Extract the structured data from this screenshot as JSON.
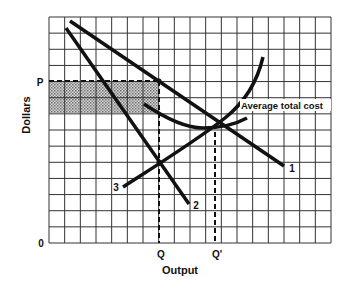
{
  "diagram": {
    "title": "",
    "axes": {
      "x_label": "Output",
      "y_label": "Dollars",
      "origin_label": "0"
    },
    "grid": {
      "columns": 18,
      "rows": 14,
      "color": "#333333"
    },
    "markers": {
      "price": {
        "label": "P"
      },
      "quantity": {
        "label": "Q"
      },
      "quantity_prime": {
        "label": "Q'"
      }
    },
    "curves": [
      {
        "id": "demand",
        "label": "1"
      },
      {
        "id": "marginal-revenue",
        "label": "2"
      },
      {
        "id": "marginal-cost",
        "label": "3"
      },
      {
        "id": "average-total-cost",
        "label": "Average total cost"
      }
    ],
    "shaded_region": {
      "description": "economic profit rectangle",
      "fill": "#9a9a9a"
    },
    "colors": {
      "line": "#111111",
      "background": "#ffffff"
    }
  }
}
